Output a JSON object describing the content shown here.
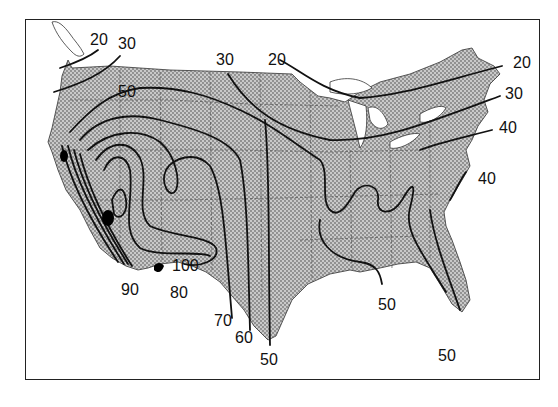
{
  "map": {
    "region": "Contiguous United States",
    "type": "isoline map",
    "colors": {
      "land_fill": "#bdbdbd",
      "stipple": "#7a7a7a",
      "water": "#ffffff",
      "contour": "#111111",
      "state_border": "#555555",
      "peak_fill": "#000000"
    },
    "contour_values": [
      20,
      30,
      40,
      50,
      60,
      70,
      80,
      90,
      100
    ],
    "labels": [
      {
        "text": "20",
        "x": 90,
        "y": 32
      },
      {
        "text": "30",
        "x": 118,
        "y": 36
      },
      {
        "text": "50",
        "x": 118,
        "y": 84
      },
      {
        "text": "30",
        "x": 216,
        "y": 52
      },
      {
        "text": "20",
        "x": 268,
        "y": 52
      },
      {
        "text": "20",
        "x": 513,
        "y": 55
      },
      {
        "text": "30",
        "x": 505,
        "y": 86
      },
      {
        "text": "40",
        "x": 499,
        "y": 120
      },
      {
        "text": "40",
        "x": 478,
        "y": 171
      },
      {
        "text": "100",
        "x": 172,
        "y": 258
      },
      {
        "text": "90",
        "x": 121,
        "y": 282
      },
      {
        "text": "80",
        "x": 170,
        "y": 285
      },
      {
        "text": "70",
        "x": 214,
        "y": 313
      },
      {
        "text": "60",
        "x": 235,
        "y": 330
      },
      {
        "text": "50",
        "x": 260,
        "y": 352
      },
      {
        "text": "50",
        "x": 378,
        "y": 297
      },
      {
        "text": "50",
        "x": 438,
        "y": 348
      }
    ]
  }
}
